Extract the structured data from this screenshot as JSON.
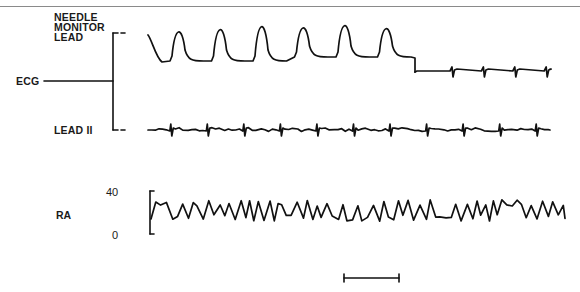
{
  "chart_data": {
    "type": "line",
    "title": "",
    "panels": [
      {
        "name": "ECG",
        "label": "ECG",
        "series": [
          {
            "name": "Needle Monitor Lead",
            "label_lines": [
              "NEEDLE",
              "MONITOR",
              "LEAD"
            ],
            "description": "Large periodic deflections (7 complexes) followed by a flat baseline with small QRS spikes (4 complexes)",
            "large_complex_count": 7,
            "small_complex_count": 4
          },
          {
            "name": "Lead II",
            "label": "LEAD II",
            "description": "Low-amplitude baseline with regular small QRS spikes",
            "complex_count": 11
          }
        ]
      },
      {
        "name": "RA",
        "label": "RA",
        "ylabel": "RA",
        "ticks": [
          "40",
          "0"
        ],
        "ylim": [
          0,
          40
        ],
        "description": "Continuous oscillating right atrial pressure trace roughly between 10 and 30",
        "approx_range": [
          10,
          30
        ]
      }
    ],
    "scale_bar": {
      "label": ""
    },
    "grid": false,
    "legend": "none"
  }
}
